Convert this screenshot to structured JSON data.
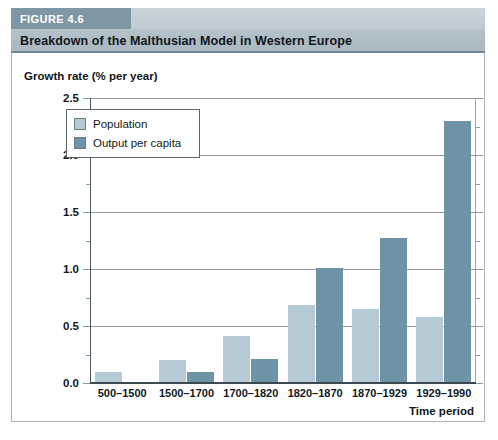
{
  "figure": {
    "badge": "FIGURE 4.6",
    "title": "Breakdown of the Malthusian Model in Western Europe"
  },
  "chart_data": {
    "type": "bar",
    "title": "Breakdown of the Malthusian Model in Western Europe",
    "xlabel": "Time period",
    "ylabel": "Growth rate (% per year)",
    "categories": [
      "500–1500",
      "1500–1700",
      "1700–1820",
      "1820–1870",
      "1870–1929",
      "1929–1990"
    ],
    "series": [
      {
        "name": "Population",
        "color": "#b6cad6",
        "values": [
          0.1,
          0.2,
          0.41,
          0.68,
          0.65,
          0.58
        ]
      },
      {
        "name": "Output per capita",
        "color": "#6e93a6",
        "values": [
          0.0,
          0.1,
          0.21,
          1.01,
          1.27,
          2.3
        ]
      }
    ],
    "ylim": [
      0.0,
      2.5
    ],
    "ytick_labels": [
      "0.0",
      "0.5",
      "1.0",
      "1.5",
      "2.0",
      "2.5"
    ],
    "ytick_values": [
      0.0,
      0.5,
      1.0,
      1.5,
      2.0,
      2.5
    ],
    "yminor_values": [
      0.25,
      0.75,
      1.25,
      1.75,
      2.25
    ],
    "grid": true,
    "legend_position": "upper left"
  }
}
